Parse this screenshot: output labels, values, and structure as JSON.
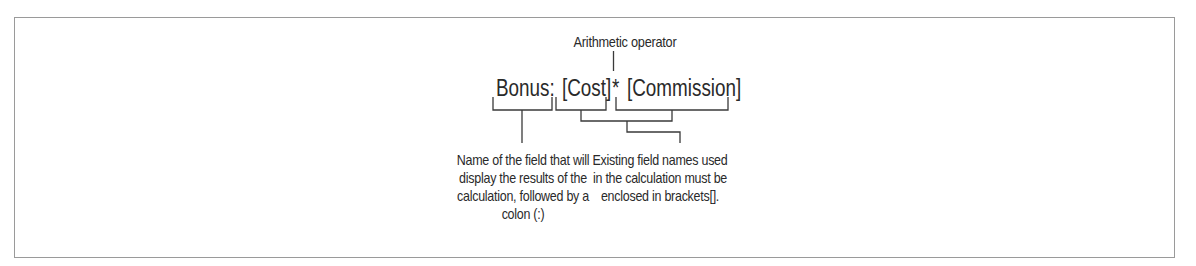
{
  "diagram": {
    "operator_label": "Arithmetic operator",
    "formula": {
      "field_name": "Bonus:",
      "operand1": "[Cost]",
      "operator": "*",
      "operand2": "[Commission]"
    },
    "annotations": {
      "left": "Name of the field that will display the results of the calculation, followed by a colon (:)",
      "right": "Existing field names used in the calculation must be enclosed in brackets[]."
    },
    "line_color": "#3a3a3a",
    "border_color": "#9a9a9a"
  }
}
